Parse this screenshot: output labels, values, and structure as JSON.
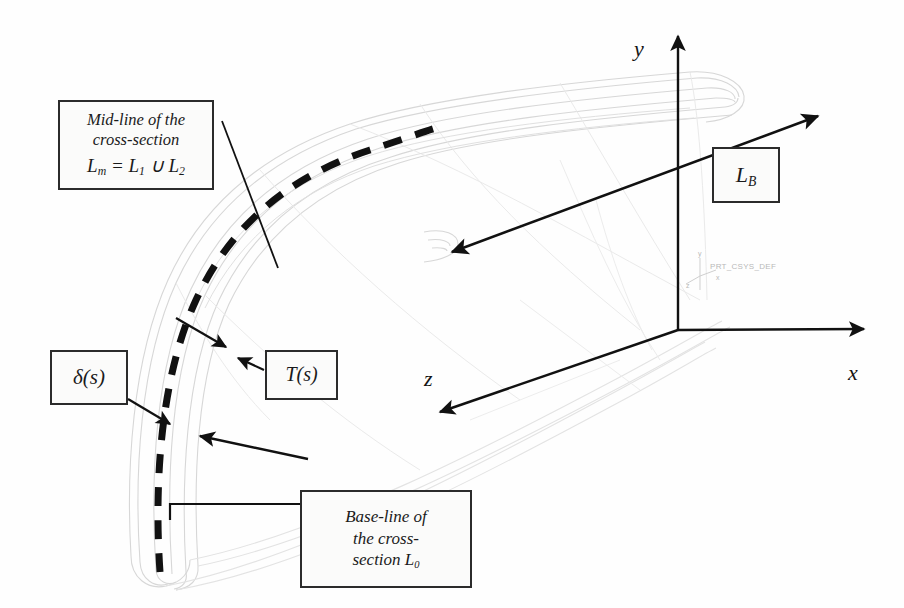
{
  "figure": {
    "kind": "engineering-diagram"
  },
  "callouts": {
    "midline": {
      "name": "mid-line-callout",
      "line1": "Mid-line of the",
      "line2": "cross-section",
      "line3_symbol": "L",
      "line3_sub": "m",
      "line3_rest": " = L",
      "line3_sub2": "1",
      "line3_union": " ∪ L",
      "line3_sub3": "2"
    },
    "delta": {
      "name": "thickness-callout",
      "label": "δ(s)"
    },
    "tangent": {
      "name": "tangent-callout",
      "label": "T(s)"
    },
    "baseline": {
      "name": "base-line-callout",
      "line1": "Base-line of",
      "line2": "the cross-",
      "line3": "section L",
      "line3_sub": "0"
    },
    "lb": {
      "name": "lb-callout",
      "symbol": "L",
      "sub": "B"
    }
  },
  "axes": {
    "y": {
      "label": "y",
      "name": "y-axis"
    },
    "x": {
      "label": "x",
      "name": "x-axis"
    },
    "z": {
      "label": "z",
      "name": "z-axis"
    }
  },
  "cad": {
    "csys_name": "PRT_CSYS_DEF",
    "tick_x": "x",
    "tick_y": "y",
    "tick_z": "z"
  },
  "colors": {
    "ink": "#1a1a1a",
    "box_border": "#2b2b2b",
    "box_fill": "#fbfbfa",
    "wireframe": "#d9d9d9",
    "wireframe_soft": "#e6e6e6",
    "cad_text": "#bdbdbd"
  }
}
